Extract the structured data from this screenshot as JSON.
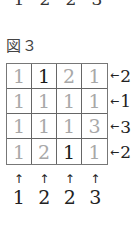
{
  "top_clues": [
    "1",
    "2",
    "2",
    "3"
  ],
  "figure": {
    "label": "図３"
  },
  "grid": {
    "rows": [
      [
        {
          "value": "1",
          "shade": "gray"
        },
        {
          "value": "1",
          "shade": "black"
        },
        {
          "value": "2",
          "shade": "gray"
        },
        {
          "value": "1",
          "shade": "gray"
        }
      ],
      [
        {
          "value": "1",
          "shade": "gray"
        },
        {
          "value": "1",
          "shade": "gray"
        },
        {
          "value": "1",
          "shade": "gray"
        },
        {
          "value": "1",
          "shade": "gray"
        }
      ],
      [
        {
          "value": "1",
          "shade": "gray"
        },
        {
          "value": "1",
          "shade": "gray"
        },
        {
          "value": "1",
          "shade": "gray"
        },
        {
          "value": "3",
          "shade": "gray"
        }
      ],
      [
        {
          "value": "1",
          "shade": "gray"
        },
        {
          "value": "2",
          "shade": "gray"
        },
        {
          "value": "1",
          "shade": "black"
        },
        {
          "value": "1",
          "shade": "gray"
        }
      ]
    ],
    "colors": {
      "gray": "#a8a8a8",
      "black": "#1a1a1a",
      "border": "#666666"
    }
  },
  "right_clues": [
    {
      "arrow": "←",
      "value": "2"
    },
    {
      "arrow": "←",
      "value": "1"
    },
    {
      "arrow": "←",
      "value": "3"
    },
    {
      "arrow": "←",
      "value": "2"
    }
  ],
  "bottom_clues": [
    {
      "arrow": "↑",
      "value": "1"
    },
    {
      "arrow": "↑",
      "value": "2"
    },
    {
      "arrow": "↑",
      "value": "2"
    },
    {
      "arrow": "↑",
      "value": "3"
    }
  ]
}
